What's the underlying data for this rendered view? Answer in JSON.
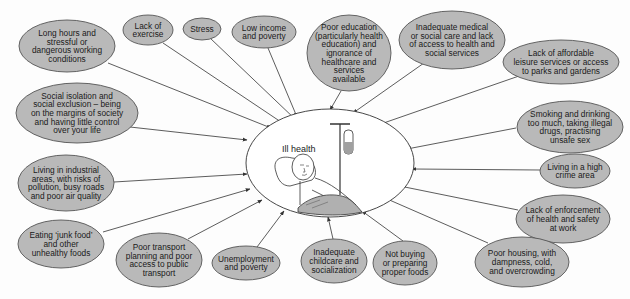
{
  "diagram": {
    "center": {
      "label": "Ill health",
      "cx": 330,
      "cy": 163,
      "rx": 84,
      "ry": 54
    },
    "colors": {
      "bubble_fill": "#b9b9b9",
      "bubble_stroke": "#555555",
      "line": "#333333",
      "background": "#fdfdfd",
      "blanket": "#b0b0b0",
      "iv_fluid": "#a0a0a0"
    },
    "factors": [
      {
        "id": "long-hours",
        "lines": [
          "Long hours and",
          "stressful or",
          "dangerous working",
          "conditions"
        ],
        "cx": 67,
        "cy": 46,
        "rx": 48,
        "ry": 26,
        "from": [
          108,
          63
        ],
        "to": [
          271,
          128
        ]
      },
      {
        "id": "lack-of-exercise",
        "lines": [
          "Lack of",
          "exercise"
        ],
        "cx": 148,
        "cy": 30,
        "rx": 25,
        "ry": 15,
        "from": [
          163,
          43
        ],
        "to": [
          284,
          124
        ]
      },
      {
        "id": "stress",
        "lines": [
          "Stress"
        ],
        "cx": 202,
        "cy": 29,
        "rx": 19,
        "ry": 11,
        "from": [
          210,
          38
        ],
        "to": [
          296,
          120
        ]
      },
      {
        "id": "low-income",
        "lines": [
          "Low income",
          "and poverty"
        ],
        "cx": 264,
        "cy": 32,
        "rx": 32,
        "ry": 16,
        "from": [
          268,
          48
        ],
        "to": [
          297,
          117
        ]
      },
      {
        "id": "poor-education",
        "lines": [
          "Poor education",
          "(particularly health",
          "education) and",
          "ignorance of",
          "healthcare and",
          "services",
          "available"
        ],
        "cx": 349,
        "cy": 53,
        "rx": 42,
        "ry": 38,
        "from": [
          341,
          91
        ],
        "to": [
          330,
          110
        ]
      },
      {
        "id": "inadequate-medical",
        "lines": [
          "Inadequate medical",
          "or social care and lack",
          "of access to health and",
          "social services"
        ],
        "cx": 452,
        "cy": 40,
        "rx": 53,
        "ry": 29,
        "from": [
          424,
          63
        ],
        "to": [
          353,
          113
        ]
      },
      {
        "id": "leisure-services",
        "lines": [
          "Lack of affordable",
          "leisure services or access",
          "to parks and gardens"
        ],
        "cx": 561,
        "cy": 62,
        "rx": 58,
        "ry": 22,
        "from": [
          519,
          76
        ],
        "to": [
          375,
          126
        ]
      },
      {
        "id": "social-isolation",
        "lines": [
          "Social isolation and",
          "social exclusion – being",
          "on the margins of society",
          "and having little control",
          "over your life"
        ],
        "cx": 77,
        "cy": 113,
        "rx": 61,
        "ry": 30,
        "from": [
          130,
          127
        ],
        "to": [
          247,
          140
        ]
      },
      {
        "id": "smoking-drinking",
        "lines": [
          "Smoking and drinking",
          "too much, taking illegal",
          "drugs, practising",
          "unsafe sex"
        ],
        "cx": 570,
        "cy": 127,
        "rx": 53,
        "ry": 26,
        "from": [
          516,
          128
        ],
        "to": [
          407,
          149
        ]
      },
      {
        "id": "industrial-areas",
        "lines": [
          "Living in industrial",
          "areas, with risks of",
          "pollution, busy roads",
          "and poor air quality"
        ],
        "cx": 66,
        "cy": 183,
        "rx": 48,
        "ry": 28,
        "from": [
          114,
          182
        ],
        "to": [
          247,
          174
        ]
      },
      {
        "id": "high-crime",
        "lines": [
          "Living in a high",
          "crime area"
        ],
        "cx": 575,
        "cy": 171,
        "rx": 35,
        "ry": 17,
        "from": [
          540,
          170
        ],
        "to": [
          412,
          169
        ]
      },
      {
        "id": "junk-food",
        "lines": [
          "Eating ‘junk food’",
          "and other",
          "unhealthy foods"
        ],
        "cx": 61,
        "cy": 244,
        "rx": 43,
        "ry": 24,
        "from": [
          103,
          232
        ],
        "to": [
          250,
          189
        ]
      },
      {
        "id": "health-safety",
        "lines": [
          "Lack of enforcement",
          "of health and safety",
          "at work"
        ],
        "cx": 563,
        "cy": 219,
        "rx": 47,
        "ry": 24,
        "from": [
          518,
          210
        ],
        "to": [
          385,
          183
        ]
      },
      {
        "id": "poor-transport",
        "lines": [
          "Poor transport",
          "planning and poor",
          "access to public",
          "transport"
        ],
        "cx": 159,
        "cy": 260,
        "rx": 43,
        "ry": 27,
        "from": [
          188,
          239
        ],
        "to": [
          262,
          200
        ]
      },
      {
        "id": "unemployment",
        "lines": [
          "Unemployment",
          "and poverty"
        ],
        "cx": 246,
        "cy": 263,
        "rx": 34,
        "ry": 17,
        "from": [
          257,
          247
        ],
        "to": [
          284,
          211
        ]
      },
      {
        "id": "childcare",
        "lines": [
          "Inadequate",
          "childcare and",
          "socialization"
        ],
        "cx": 334,
        "cy": 261,
        "rx": 33,
        "ry": 22,
        "from": [
          333,
          239
        ],
        "to": [
          328,
          217
        ]
      },
      {
        "id": "proper-foods",
        "lines": [
          "Not buying",
          "or preparing",
          "proper foods"
        ],
        "cx": 405,
        "cy": 263,
        "rx": 32,
        "ry": 22,
        "from": [
          403,
          241
        ],
        "to": [
          362,
          211
        ]
      },
      {
        "id": "poor-housing",
        "lines": [
          "Poor housing, with",
          "dampness, cold,",
          "and overcrowding"
        ],
        "cx": 522,
        "cy": 262,
        "rx": 47,
        "ry": 25,
        "from": [
          488,
          243
        ],
        "to": [
          378,
          195
        ]
      }
    ]
  }
}
